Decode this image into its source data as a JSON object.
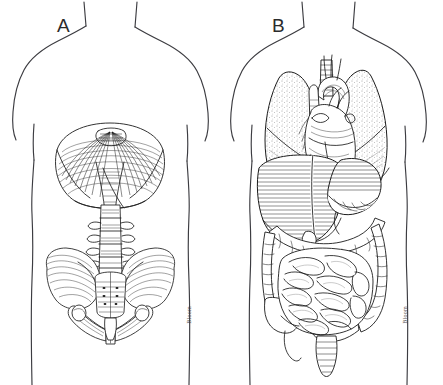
{
  "figure": {
    "width": 443,
    "height": 385,
    "background_color": "#ffffff",
    "ink_color": "#1c1c1c",
    "outline_color": "#3c3c41",
    "style": "pen-and-ink line drawing with hatching and stipple shading"
  },
  "panels": [
    {
      "id": "panel-a",
      "label": "A",
      "signature": "Bloom",
      "description": "Anterior torso outline containing the diaphragm, lumbar vertebral column, sacrum and bony pelvis",
      "structures": [
        "diaphragm",
        "central tendon of diaphragm",
        "crura of diaphragm",
        "lumbar vertebrae",
        "sacrum",
        "coccyx",
        "ilium",
        "pubic symphysis",
        "ischium"
      ]
    },
    {
      "id": "panel-b",
      "label": "B",
      "signature": "Bloom",
      "description": "Anterior torso outline containing the thoracic and abdominal viscera in situ",
      "structures": [
        "right lung",
        "left lung",
        "heart",
        "aortic arch",
        "great vessels",
        "trachea",
        "liver",
        "stomach",
        "gallbladder",
        "transverse colon",
        "ascending colon",
        "descending colon",
        "small intestine",
        "cecum",
        "appendix",
        "sigmoid colon",
        "rectum"
      ]
    }
  ]
}
